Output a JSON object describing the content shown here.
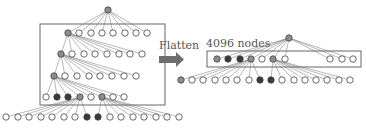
{
  "labels": {
    "flatten": "Flatten",
    "nodes_count": "4096 nodes"
  },
  "colors": {
    "line": "#8a8a8a",
    "box": "#666666",
    "node_empty": "#ffffff",
    "node_gray": "#8c8c8c",
    "node_dark": "#3a3a3a",
    "arrow": "#6e6e6e"
  },
  "left_tree": {
    "root": {
      "x": 108,
      "y": 10,
      "kind": "gray"
    },
    "box": {
      "x": 40,
      "y": 24,
      "w": 125,
      "h": 81
    },
    "rows": [
      {
        "y": 33,
        "xs": [
          68,
          79,
          91,
          102,
          113,
          125,
          136,
          147
        ],
        "kinds": [
          "gray",
          "e",
          "e",
          "e",
          "e",
          "e",
          "e",
          "e"
        ]
      },
      {
        "y": 54,
        "xs": [
          61,
          72,
          84,
          95,
          107,
          119,
          130,
          142
        ],
        "kinds": [
          "gray",
          "e",
          "e",
          "e",
          "e",
          "e",
          "e",
          "e"
        ]
      },
      {
        "y": 76,
        "xs": [
          54,
          65,
          77,
          89,
          100,
          112,
          124,
          136
        ],
        "kinds": [
          "gray",
          "e",
          "e",
          "e",
          "e",
          "e",
          "e",
          "e"
        ]
      },
      {
        "y": 97,
        "xs": [
          46,
          57,
          68,
          80,
          91,
          102,
          113,
          124
        ],
        "kinds": [
          "e",
          "dark",
          "dark",
          "gray",
          "e",
          "gray",
          "e",
          "e"
        ]
      }
    ],
    "bottom": {
      "y": 117,
      "xs": [
        6,
        18,
        29,
        41,
        52,
        64,
        75,
        87,
        98,
        110,
        121,
        133,
        144,
        156,
        167,
        179
      ],
      "kinds": [
        "e",
        "e",
        "e",
        "e",
        "e",
        "e",
        "e",
        "dark",
        "dark",
        "e",
        "e",
        "e",
        "e",
        "e",
        "e",
        "e"
      ]
    }
  },
  "right_tree": {
    "root": {
      "x": 289,
      "y": 38,
      "kind": "gray"
    },
    "box": {
      "x": 207,
      "y": 51,
      "w": 154,
      "h": 16
    },
    "row": {
      "y": 59,
      "xs": [
        217,
        228,
        240,
        251,
        262,
        273,
        285,
        330,
        342,
        353
      ],
      "kinds": [
        "gray",
        "dark",
        "dark",
        "gray",
        "e",
        "gray",
        "e",
        "e",
        "e",
        "e"
      ]
    },
    "bottom": {
      "y": 80,
      "xs": [
        181,
        192,
        203,
        215,
        226,
        237,
        249,
        260,
        271,
        282,
        294,
        305,
        316,
        327,
        339,
        350
      ],
      "kinds": [
        "gray",
        "e",
        "e",
        "e",
        "e",
        "e",
        "e",
        "dark",
        "dark",
        "e",
        "e",
        "e",
        "e",
        "e",
        "e",
        "e"
      ]
    }
  }
}
